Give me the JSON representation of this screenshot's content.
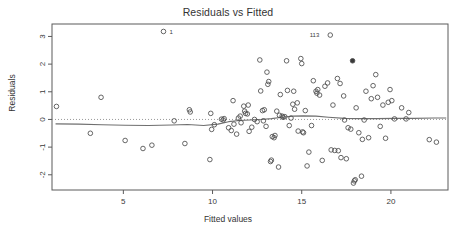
{
  "chart_data": {
    "type": "scatter",
    "title": "Residuals vs Fitted",
    "xlabel": "Fitted values",
    "ylabel": "Residuals",
    "xlim": [
      1.0,
      23.2
    ],
    "ylim": [
      -2.55,
      3.45
    ],
    "xticks": [
      5,
      10,
      15,
      20
    ],
    "yticks": [
      3,
      2,
      1,
      0,
      -1,
      -2
    ],
    "xtick_labels": [
      "5",
      "10",
      "15",
      "20"
    ],
    "ytick_labels": [
      "3",
      "2",
      "1",
      "0",
      "-1",
      "-2"
    ],
    "grid": false,
    "legend": null,
    "marker": "open-circle",
    "marker_color": "#4c4c4c",
    "reference_line": {
      "y": 0,
      "style": "dotted",
      "color": "#9a9a9a"
    },
    "smoother": {
      "name": "lowess",
      "style": "solid",
      "color": "#6f6f6f",
      "x": [
        1.2,
        2.5,
        3.8,
        5.1,
        6.4,
        7.7,
        8.6,
        9.5,
        10.3,
        10.9,
        11.5,
        12.1,
        12.7,
        13.3,
        13.9,
        14.5,
        15.1,
        15.8,
        16.5,
        17.4,
        18.3,
        19.2,
        20.2,
        21.3,
        22.4,
        23.1
      ],
      "y": [
        -0.16,
        -0.17,
        -0.19,
        -0.21,
        -0.22,
        -0.2,
        -0.18,
        -0.22,
        -0.17,
        -0.08,
        -0.04,
        -0.02,
        0.0,
        0.03,
        0.08,
        0.12,
        0.13,
        0.12,
        0.08,
        0.04,
        0.03,
        0.03,
        0.04,
        0.04,
        0.05,
        0.05
      ]
    },
    "annotations": [
      {
        "label": "1",
        "x": 7.3,
        "y": 3.18,
        "dx": 5,
        "dy": 3
      },
      {
        "label": "113",
        "x": 16.6,
        "y": 3.05,
        "dx": -11,
        "dy": 2
      }
    ],
    "points": [
      {
        "x": 1.25,
        "y": 0.47
      },
      {
        "x": 3.15,
        "y": -0.5
      },
      {
        "x": 3.75,
        "y": 0.8
      },
      {
        "x": 5.1,
        "y": -0.76
      },
      {
        "x": 6.1,
        "y": -1.05
      },
      {
        "x": 6.6,
        "y": -0.93
      },
      {
        "x": 7.25,
        "y": 3.18
      },
      {
        "x": 7.85,
        "y": -0.05
      },
      {
        "x": 8.45,
        "y": -0.87
      },
      {
        "x": 8.75,
        "y": 0.27
      },
      {
        "x": 8.7,
        "y": 0.35
      },
      {
        "x": 9.85,
        "y": -1.45
      },
      {
        "x": 9.9,
        "y": 0.22
      },
      {
        "x": 9.95,
        "y": -0.36
      },
      {
        "x": 10.1,
        "y": -0.19
      },
      {
        "x": 10.5,
        "y": 0.01
      },
      {
        "x": 10.6,
        "y": -0.02
      },
      {
        "x": 10.65,
        "y": 0.03
      },
      {
        "x": 10.9,
        "y": -0.3
      },
      {
        "x": 11.05,
        "y": -0.4
      },
      {
        "x": 11.15,
        "y": 0.68
      },
      {
        "x": 11.2,
        "y": -0.17
      },
      {
        "x": 11.35,
        "y": -0.53
      },
      {
        "x": 11.45,
        "y": 0.05
      },
      {
        "x": 11.55,
        "y": 0.12
      },
      {
        "x": 11.6,
        "y": -0.12
      },
      {
        "x": 11.75,
        "y": 0.48
      },
      {
        "x": 11.8,
        "y": 0.3
      },
      {
        "x": 11.85,
        "y": 0.22
      },
      {
        "x": 11.95,
        "y": 0.2
      },
      {
        "x": 12.0,
        "y": 0.52
      },
      {
        "x": 12.05,
        "y": -0.43
      },
      {
        "x": 12.2,
        "y": -0.28
      },
      {
        "x": 12.35,
        "y": 0.0
      },
      {
        "x": 12.5,
        "y": -0.08
      },
      {
        "x": 12.65,
        "y": 2.15
      },
      {
        "x": 12.7,
        "y": 1.03
      },
      {
        "x": 12.8,
        "y": 0.32
      },
      {
        "x": 12.85,
        "y": -0.05
      },
      {
        "x": 12.9,
        "y": 0.35
      },
      {
        "x": 13.0,
        "y": -0.25
      },
      {
        "x": 13.05,
        "y": 1.71
      },
      {
        "x": 13.1,
        "y": 1.27
      },
      {
        "x": 13.15,
        "y": 1.37
      },
      {
        "x": 13.25,
        "y": -1.52
      },
      {
        "x": 13.3,
        "y": -1.47
      },
      {
        "x": 13.35,
        "y": -0.62
      },
      {
        "x": 13.45,
        "y": -0.66
      },
      {
        "x": 13.5,
        "y": -0.58
      },
      {
        "x": 13.6,
        "y": 0.3
      },
      {
        "x": 13.7,
        "y": -1.72
      },
      {
        "x": 13.75,
        "y": 0.15
      },
      {
        "x": 13.8,
        "y": 0.9
      },
      {
        "x": 13.9,
        "y": 0.12
      },
      {
        "x": 13.95,
        "y": 0.08
      },
      {
        "x": 14.05,
        "y": 0.1
      },
      {
        "x": 14.15,
        "y": 2.12
      },
      {
        "x": 14.2,
        "y": 1.05
      },
      {
        "x": 14.3,
        "y": -0.22
      },
      {
        "x": 14.4,
        "y": 0.05
      },
      {
        "x": 14.5,
        "y": 0.55
      },
      {
        "x": 14.55,
        "y": 1.02
      },
      {
        "x": 14.6,
        "y": 0.37
      },
      {
        "x": 14.75,
        "y": 0.6
      },
      {
        "x": 14.8,
        "y": -0.42
      },
      {
        "x": 14.95,
        "y": 2.2
      },
      {
        "x": 15.0,
        "y": 2.02
      },
      {
        "x": 15.05,
        "y": -0.45
      },
      {
        "x": 15.1,
        "y": -0.48
      },
      {
        "x": 15.2,
        "y": 0.32
      },
      {
        "x": 15.3,
        "y": -1.68
      },
      {
        "x": 15.4,
        "y": -1.18
      },
      {
        "x": 15.55,
        "y": -0.22
      },
      {
        "x": 15.65,
        "y": 1.4
      },
      {
        "x": 15.8,
        "y": 1.02
      },
      {
        "x": 15.85,
        "y": 0.95
      },
      {
        "x": 15.9,
        "y": 1.08
      },
      {
        "x": 16.0,
        "y": 0.88
      },
      {
        "x": 16.15,
        "y": -1.48
      },
      {
        "x": 16.3,
        "y": 1.2
      },
      {
        "x": 16.45,
        "y": 1.32
      },
      {
        "x": 16.6,
        "y": 3.05
      },
      {
        "x": 16.65,
        "y": -1.1
      },
      {
        "x": 16.75,
        "y": 0.52
      },
      {
        "x": 16.85,
        "y": -1.12
      },
      {
        "x": 17.0,
        "y": 1.48
      },
      {
        "x": 17.05,
        "y": -1.13
      },
      {
        "x": 17.15,
        "y": 1.3
      },
      {
        "x": 17.2,
        "y": -1.38
      },
      {
        "x": 17.35,
        "y": 0.85
      },
      {
        "x": 17.4,
        "y": -0.02
      },
      {
        "x": 17.5,
        "y": -1.42
      },
      {
        "x": 17.6,
        "y": -0.3
      },
      {
        "x": 17.75,
        "y": -0.35
      },
      {
        "x": 17.85,
        "y": 2.12
      },
      {
        "x": 17.9,
        "y": -2.3
      },
      {
        "x": 17.95,
        "y": -2.22
      },
      {
        "x": 18.0,
        "y": -2.18
      },
      {
        "x": 18.05,
        "y": 0.42
      },
      {
        "x": 18.2,
        "y": -0.48
      },
      {
        "x": 18.35,
        "y": -2.05
      },
      {
        "x": 18.4,
        "y": -0.72
      },
      {
        "x": 18.5,
        "y": -0.02
      },
      {
        "x": 18.6,
        "y": 1.02
      },
      {
        "x": 18.75,
        "y": -0.66
      },
      {
        "x": 18.9,
        "y": 0.75
      },
      {
        "x": 19.0,
        "y": 1.22
      },
      {
        "x": 19.15,
        "y": 1.62
      },
      {
        "x": 19.25,
        "y": 0.8
      },
      {
        "x": 19.4,
        "y": -0.25
      },
      {
        "x": 19.55,
        "y": 0.52
      },
      {
        "x": 19.7,
        "y": -0.68
      },
      {
        "x": 19.85,
        "y": 0.62
      },
      {
        "x": 19.95,
        "y": 1.08
      },
      {
        "x": 20.05,
        "y": 0.68
      },
      {
        "x": 20.2,
        "y": 0.02
      },
      {
        "x": 20.6,
        "y": 0.42
      },
      {
        "x": 20.85,
        "y": 0.02
      },
      {
        "x": 21.0,
        "y": 0.25
      },
      {
        "x": 22.15,
        "y": -0.73
      },
      {
        "x": 22.55,
        "y": -0.82
      }
    ],
    "filled_points": [
      {
        "x": 17.85,
        "y": 2.12
      }
    ]
  }
}
